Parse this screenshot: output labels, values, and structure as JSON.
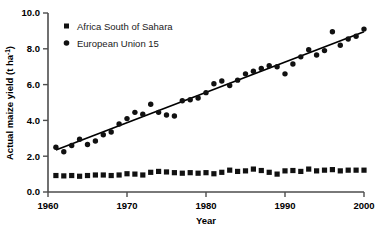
{
  "chart_data": {
    "type": "scatter",
    "title": "",
    "xlabel": "Year",
    "ylabel": "Actual maize yield (t ha-1)",
    "ylabel_main": "Actual maize yield (t ha",
    "ylabel_sup": "-1",
    "ylabel_tail": ")",
    "xlim": [
      1960,
      2000
    ],
    "ylim": [
      0.0,
      10.0
    ],
    "xticks": [
      1960,
      1970,
      1980,
      1990,
      2000
    ],
    "xtick_labels": [
      "1960",
      "1970",
      "1980",
      "1990",
      "2000"
    ],
    "yticks": [
      0.0,
      2.0,
      4.0,
      6.0,
      8.0,
      10.0
    ],
    "ytick_labels": [
      "0.0",
      "2.0",
      "4.0",
      "6.0",
      "8.0",
      "10.0"
    ],
    "grid": false,
    "legend_position": "top-left",
    "x": [
      1961,
      1962,
      1963,
      1964,
      1965,
      1966,
      1967,
      1968,
      1969,
      1970,
      1971,
      1972,
      1973,
      1974,
      1975,
      1976,
      1977,
      1978,
      1979,
      1980,
      1981,
      1982,
      1983,
      1984,
      1985,
      1986,
      1987,
      1988,
      1989,
      1990,
      1991,
      1992,
      1993,
      1994,
      1995,
      1996,
      1997,
      1998,
      1999,
      2000
    ],
    "series": [
      {
        "name": "Africa South of Sahara",
        "marker": "square",
        "color": "#111111",
        "values": [
          0.92,
          0.9,
          0.92,
          0.88,
          0.92,
          0.95,
          0.95,
          0.92,
          0.95,
          1.02,
          1.0,
          0.95,
          1.1,
          1.15,
          1.12,
          1.08,
          1.05,
          1.08,
          1.05,
          1.08,
          1.02,
          1.1,
          1.22,
          1.15,
          1.18,
          1.28,
          1.2,
          1.1,
          1.0,
          1.18,
          1.2,
          1.15,
          1.28,
          1.18,
          1.22,
          1.25,
          1.18,
          1.22,
          1.22,
          1.22
        ]
      },
      {
        "name": "European Union 15",
        "marker": "circle",
        "color": "#111111",
        "values": [
          2.5,
          2.25,
          2.6,
          2.95,
          2.65,
          2.85,
          3.2,
          3.35,
          3.8,
          4.1,
          4.45,
          4.35,
          4.9,
          4.45,
          4.3,
          4.25,
          5.1,
          5.15,
          5.25,
          5.55,
          6.05,
          6.2,
          5.95,
          6.25,
          6.6,
          6.75,
          6.9,
          7.05,
          7.0,
          6.6,
          7.15,
          7.55,
          7.95,
          7.65,
          7.9,
          8.95,
          8.2,
          8.55,
          8.7,
          9.1
        ]
      }
    ],
    "trendline": {
      "name": "European Union 15 linear fit",
      "x_start": 1961,
      "y_start": 2.35,
      "x_end": 2000,
      "y_end": 8.95
    },
    "legend": [
      {
        "label": "Africa South of Sahara",
        "marker": "square"
      },
      {
        "label": "European Union 15",
        "marker": "circle"
      }
    ]
  }
}
